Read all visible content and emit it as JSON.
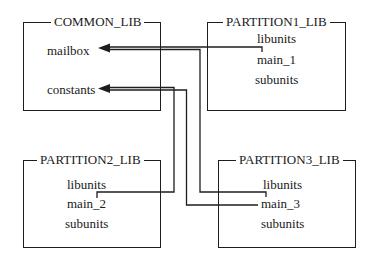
{
  "diagram": {
    "boxes": [
      {
        "id": "common",
        "title": "COMMON_LIB",
        "items": [
          "mailbox",
          "constants"
        ]
      },
      {
        "id": "p1",
        "title": "PARTITION1_LIB",
        "items": [
          "libunits",
          "main_1",
          "subunits"
        ]
      },
      {
        "id": "p2",
        "title": "PARTITION2_LIB",
        "items": [
          "libunits",
          "main_2",
          "subunits"
        ]
      },
      {
        "id": "p3",
        "title": "PARTITION3_LIB",
        "items": [
          "libunits",
          "main_3",
          "subunits"
        ]
      }
    ],
    "connections": [
      {
        "from": "PARTITION1_LIB.main_1",
        "to": "COMMON_LIB.mailbox"
      },
      {
        "from": "PARTITION3_LIB.main_3",
        "to": "COMMON_LIB.mailbox"
      },
      {
        "from": "PARTITION2_LIB.main_2",
        "to": "COMMON_LIB.constants"
      },
      {
        "from": "PARTITION3_LIB.main_3",
        "to": "COMMON_LIB.constants"
      }
    ]
  }
}
